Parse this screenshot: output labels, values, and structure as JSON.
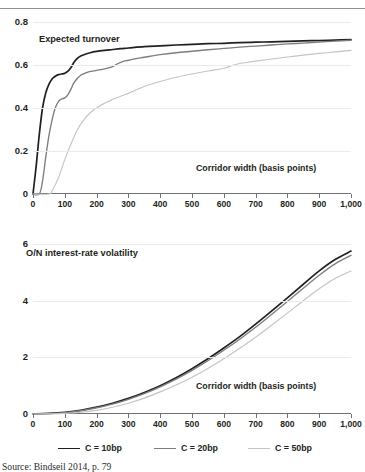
{
  "figure": {
    "source_note": "Source: Bindseil 2014, p. 79"
  },
  "legend": {
    "position": "bottom",
    "items": [
      {
        "label": "C = 10bp",
        "color": "#231f20"
      },
      {
        "label": "C = 20bp",
        "color": "#7b7d80"
      },
      {
        "label": "C = 50bp",
        "color": "#c2c4c6"
      }
    ]
  },
  "chart_data": [
    {
      "type": "line",
      "id": "expected-turnover",
      "title": "Expected turnover",
      "xlabel": "Corridor width (basis points)",
      "ylabel": "",
      "xlim": [
        0,
        1000
      ],
      "ylim": [
        0,
        0.8
      ],
      "grid": true,
      "xticks": [
        0,
        100,
        200,
        300,
        400,
        500,
        600,
        700,
        800,
        900,
        1000
      ],
      "xticklabels": [
        "0",
        "100",
        "200",
        "300",
        "400",
        "500",
        "600",
        "700",
        "800",
        "900",
        "1,000"
      ],
      "yticks": [
        0,
        0.2,
        0.4,
        0.6,
        0.8
      ],
      "yticklabels": [
        "0",
        "0.2",
        "0.4",
        "0.6",
        "0.8"
      ],
      "series": [
        {
          "name": "C = 10bp",
          "color": "#231f20",
          "x": [
            0,
            10,
            20,
            30,
            40,
            50,
            60,
            70,
            80,
            90,
            100,
            110,
            120,
            130,
            140,
            150,
            160,
            180,
            200,
            225,
            250,
            275,
            300,
            350,
            400,
            450,
            500,
            550,
            600,
            650,
            700,
            750,
            800,
            850,
            900,
            950,
            1000
          ],
          "values": [
            0.0,
            0.13,
            0.28,
            0.4,
            0.47,
            0.51,
            0.535,
            0.548,
            0.555,
            0.558,
            0.562,
            0.572,
            0.59,
            0.615,
            0.632,
            0.642,
            0.648,
            0.657,
            0.663,
            0.668,
            0.672,
            0.676,
            0.679,
            0.685,
            0.689,
            0.693,
            0.696,
            0.699,
            0.701,
            0.704,
            0.706,
            0.708,
            0.71,
            0.712,
            0.714,
            0.716,
            0.718
          ]
        },
        {
          "name": "C = 20bp",
          "color": "#7b7d80",
          "x": [
            0,
            20,
            30,
            40,
            50,
            60,
            70,
            80,
            90,
            100,
            110,
            120,
            130,
            150,
            175,
            200,
            225,
            250,
            265,
            280,
            300,
            325,
            350,
            400,
            450,
            500,
            550,
            600,
            650,
            700,
            750,
            800,
            850,
            900,
            950,
            1000
          ],
          "values": [
            0.0,
            0.0,
            0.06,
            0.17,
            0.27,
            0.345,
            0.4,
            0.43,
            0.442,
            0.447,
            0.462,
            0.49,
            0.52,
            0.552,
            0.568,
            0.575,
            0.582,
            0.592,
            0.605,
            0.615,
            0.622,
            0.63,
            0.636,
            0.648,
            0.657,
            0.664,
            0.671,
            0.677,
            0.683,
            0.688,
            0.693,
            0.698,
            0.702,
            0.707,
            0.711,
            0.715
          ]
        },
        {
          "name": "C = 50bp",
          "color": "#c2c4c6",
          "x": [
            0,
            50,
            60,
            80,
            100,
            120,
            140,
            160,
            180,
            200,
            220,
            240,
            260,
            280,
            300,
            325,
            350,
            400,
            450,
            500,
            550,
            600,
            625,
            650,
            675,
            700,
            750,
            800,
            850,
            900,
            950,
            1000
          ],
          "values": [
            0.0,
            0.0,
            0.015,
            0.075,
            0.16,
            0.235,
            0.3,
            0.345,
            0.378,
            0.4,
            0.418,
            0.432,
            0.445,
            0.457,
            0.468,
            0.485,
            0.5,
            0.523,
            0.543,
            0.558,
            0.572,
            0.585,
            0.597,
            0.607,
            0.613,
            0.618,
            0.628,
            0.637,
            0.646,
            0.654,
            0.661,
            0.668
          ]
        }
      ]
    },
    {
      "type": "line",
      "id": "overnight-interest-rate-volatility",
      "title": "O/N interest-rate volatility",
      "xlabel": "Corridor width (basis points)",
      "ylabel": "",
      "xlim": [
        0,
        1000
      ],
      "ylim": [
        0,
        6
      ],
      "grid": true,
      "xticks": [
        0,
        100,
        200,
        300,
        400,
        500,
        600,
        700,
        800,
        900,
        1000
      ],
      "xticklabels": [
        "0",
        "100",
        "200",
        "300",
        "400",
        "500",
        "600",
        "700",
        "800",
        "900",
        "1,000"
      ],
      "yticks": [
        0,
        2,
        4,
        6
      ],
      "yticklabels": [
        "0",
        "2",
        "4",
        "6"
      ],
      "series": [
        {
          "name": "C = 10bp",
          "color": "#231f20",
          "x": [
            0,
            50,
            100,
            150,
            200,
            250,
            300,
            350,
            400,
            450,
            500,
            550,
            600,
            650,
            700,
            750,
            800,
            850,
            900,
            950,
            1000
          ],
          "values": [
            0.0,
            0.02,
            0.06,
            0.13,
            0.24,
            0.38,
            0.55,
            0.76,
            1.0,
            1.28,
            1.6,
            1.95,
            2.33,
            2.73,
            3.17,
            3.63,
            4.1,
            4.58,
            5.05,
            5.45,
            5.75
          ]
        },
        {
          "name": "C = 20bp",
          "color": "#7b7d80",
          "x": [
            0,
            50,
            100,
            150,
            200,
            250,
            300,
            350,
            400,
            450,
            500,
            550,
            600,
            650,
            700,
            750,
            800,
            850,
            900,
            950,
            1000
          ],
          "values": [
            0.0,
            0.015,
            0.05,
            0.115,
            0.22,
            0.35,
            0.52,
            0.72,
            0.96,
            1.23,
            1.54,
            1.88,
            2.25,
            2.64,
            3.06,
            3.51,
            3.97,
            4.44,
            4.9,
            5.3,
            5.6
          ]
        },
        {
          "name": "C = 50bp",
          "color": "#c2c4c6",
          "x": [
            0,
            50,
            100,
            150,
            200,
            250,
            300,
            350,
            400,
            450,
            500,
            550,
            600,
            650,
            700,
            750,
            800,
            850,
            900,
            950,
            1000
          ],
          "values": [
            0.0,
            0.005,
            0.02,
            0.06,
            0.13,
            0.24,
            0.38,
            0.56,
            0.78,
            1.02,
            1.3,
            1.61,
            1.95,
            2.32,
            2.71,
            3.13,
            3.56,
            4.0,
            4.42,
            4.78,
            5.05
          ]
        }
      ]
    }
  ]
}
